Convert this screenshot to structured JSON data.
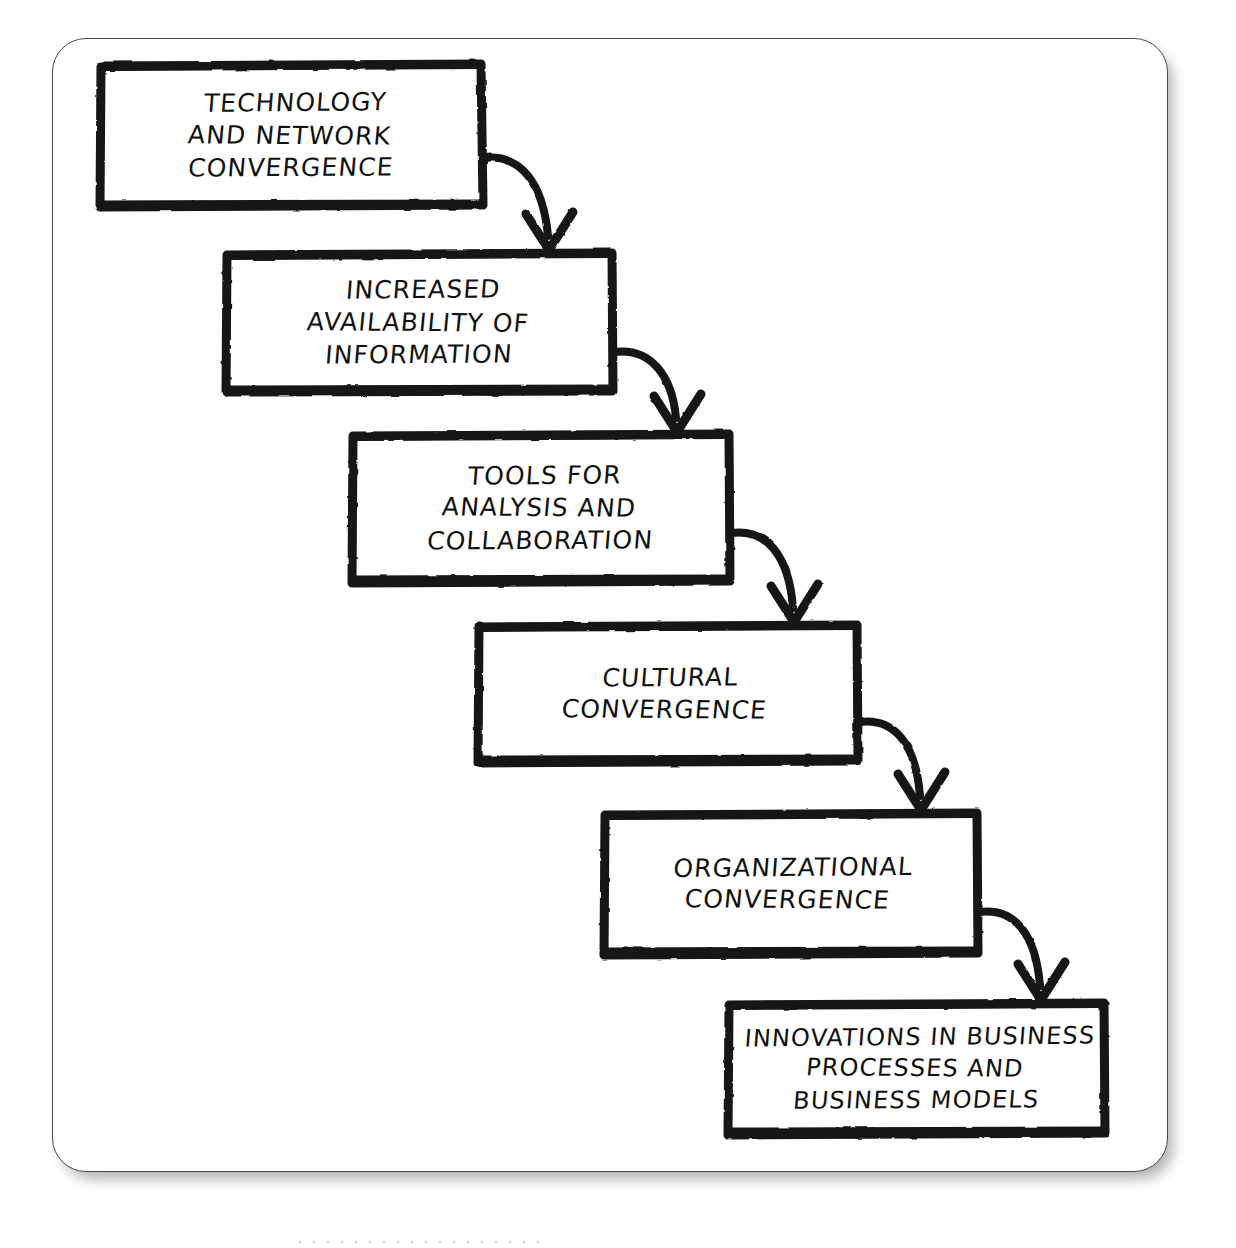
{
  "diagram": {
    "type": "cascading-staircase-flowchart",
    "style": "hand-drawn sketch, black ink on white, rounded outer frame with drop shadow",
    "orientation": "top-left to bottom-right descending staircase",
    "node_count": 6,
    "connector_count": 5,
    "connector_style": "hand-drawn curved arrow from right edge of box arcing down to top edge of next box, V-shaped arrowhead",
    "nodes": [
      {
        "id": "node-1",
        "index": 1,
        "lines": [
          "Technology",
          "and Network",
          "Convergence"
        ],
        "text": "Technology and Network Convergence"
      },
      {
        "id": "node-2",
        "index": 2,
        "lines": [
          "Increased",
          "Availability of",
          "Information"
        ],
        "text": "Increased Availability of Information"
      },
      {
        "id": "node-3",
        "index": 3,
        "lines": [
          "Tools for",
          "Analysis and",
          "Collaboration"
        ],
        "text": "Tools for Analysis and Collaboration"
      },
      {
        "id": "node-4",
        "index": 4,
        "lines": [
          "Cultural",
          "Convergence"
        ],
        "text": "Cultural Convergence"
      },
      {
        "id": "node-5",
        "index": 5,
        "lines": [
          "Organizational",
          "Convergence"
        ],
        "text": "Organizational Convergence"
      },
      {
        "id": "node-6",
        "index": 6,
        "lines": [
          "Innovations in Business",
          "Processes and",
          "Business Models"
        ],
        "text": "Innovations in Business Processes and Business Models"
      }
    ],
    "edges": [
      {
        "id": "edge-1",
        "from": "node-1",
        "to": "node-2",
        "label": ""
      },
      {
        "id": "edge-2",
        "from": "node-2",
        "to": "node-3",
        "label": ""
      },
      {
        "id": "edge-3",
        "from": "node-3",
        "to": "node-4",
        "label": ""
      },
      {
        "id": "edge-4",
        "from": "node-4",
        "to": "node-5",
        "label": ""
      },
      {
        "id": "edge-5",
        "from": "node-5",
        "to": "node-6",
        "label": ""
      }
    ],
    "colors": {
      "ink": "#111111",
      "box_stroke": "#141414",
      "arrow_stroke": "#141414",
      "frame_stroke": "#4a4a4a",
      "background": "#ffffff"
    }
  }
}
